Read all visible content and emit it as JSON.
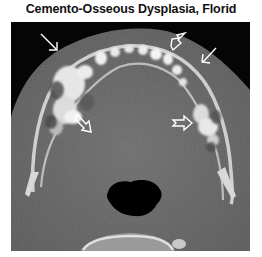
{
  "figure": {
    "title": "Cemento-Osseous Dysplasia, Florid",
    "image": {
      "modality": "axial CT",
      "description": "Axial CT of the mandible with multiple lobulated sclerotic masses in the alveolar ridge",
      "annotations": [
        {
          "type": "arrow",
          "style": "open-head",
          "location": "left anterior mandible"
        },
        {
          "type": "arrow",
          "style": "open-head",
          "location": "right anterior mandible"
        },
        {
          "type": "arrow",
          "style": "open-head-notched",
          "location": "anterior symphysis"
        },
        {
          "type": "arrow",
          "style": "open-head-notched",
          "location": "left posterior mandible"
        },
        {
          "type": "arrow",
          "style": "open-head-notched",
          "location": "right posterior mandible"
        }
      ]
    }
  }
}
